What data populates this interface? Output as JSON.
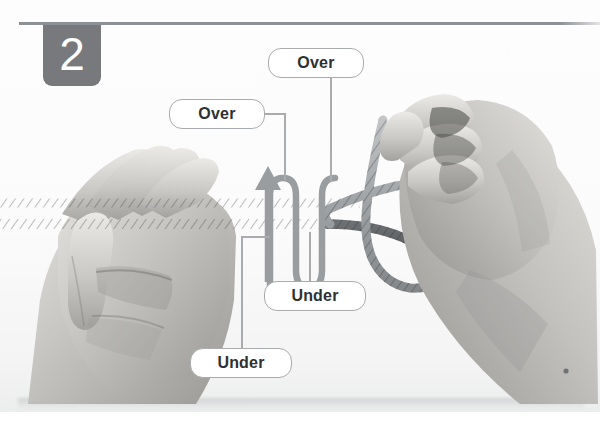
{
  "illustration": {
    "title_number": "2",
    "subject": "two hands weaving a rope to tie a knot",
    "top_rule": true,
    "dot_mark": "•"
  },
  "colors": {
    "badge_bg": "#77797d",
    "badge_text": "#ffffff",
    "rule": "#8d9094",
    "pill_border": "#a9abad",
    "pill_bg": "#ffffff",
    "pill_text": "#2e3032",
    "leader": "#a9abad",
    "arrow": "#9a9da0",
    "rope_light": "#a8aaad",
    "rope_dark": "#55585b",
    "skin_light": "#d7d6d3",
    "skin_mid": "#b9b8b5",
    "skin_dark": "#8e8d8a",
    "background": "#fdfdfd"
  },
  "labels": [
    {
      "id": "over-top",
      "text": "Over",
      "x": 268,
      "y": 48,
      "w": 96,
      "h": 30
    },
    {
      "id": "over-left",
      "text": "Over",
      "x": 169,
      "y": 99,
      "w": 96,
      "h": 30
    },
    {
      "id": "under-mid",
      "text": "Under",
      "x": 264,
      "y": 281,
      "w": 102,
      "h": 30
    },
    {
      "id": "under-low",
      "text": "Under",
      "x": 190,
      "y": 348,
      "w": 102,
      "h": 30
    }
  ],
  "annotation_sequence": [
    "Over",
    "Over",
    "Under",
    "Under"
  ],
  "arrow": {
    "direction": "up",
    "meaning": "weave direction of working end through the strands"
  }
}
